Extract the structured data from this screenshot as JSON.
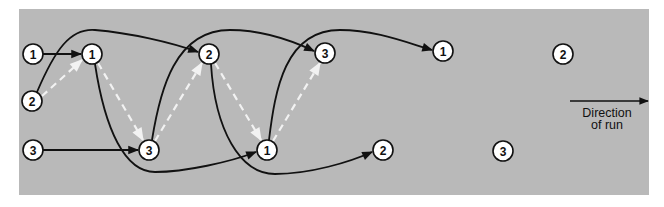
{
  "figure": {
    "background_color": "#ffffff",
    "panel_color": "#b9b9b9",
    "line_color": "#111111",
    "dashed_color": "#f2f2f2",
    "direction_label_line1": "Direction",
    "direction_label_line2": "of run"
  },
  "nodes": [
    {
      "id": "a1",
      "label": "1",
      "x": 33,
      "y": 54
    },
    {
      "id": "a2",
      "label": "2",
      "x": 32,
      "y": 101
    },
    {
      "id": "a3",
      "label": "3",
      "x": 33,
      "y": 150
    },
    {
      "id": "b1",
      "label": "1",
      "x": 92,
      "y": 54
    },
    {
      "id": "b3",
      "label": "3",
      "x": 149,
      "y": 150
    },
    {
      "id": "c2",
      "label": "2",
      "x": 209,
      "y": 54
    },
    {
      "id": "c1",
      "label": "1",
      "x": 267,
      "y": 150
    },
    {
      "id": "d3",
      "label": "3",
      "x": 325,
      "y": 53
    },
    {
      "id": "d2",
      "label": "2",
      "x": 383,
      "y": 150
    },
    {
      "id": "e1",
      "label": "1",
      "x": 443,
      "y": 51
    },
    {
      "id": "e3",
      "label": "3",
      "x": 503,
      "y": 151
    },
    {
      "id": "f2",
      "label": "2",
      "x": 563,
      "y": 54
    }
  ]
}
